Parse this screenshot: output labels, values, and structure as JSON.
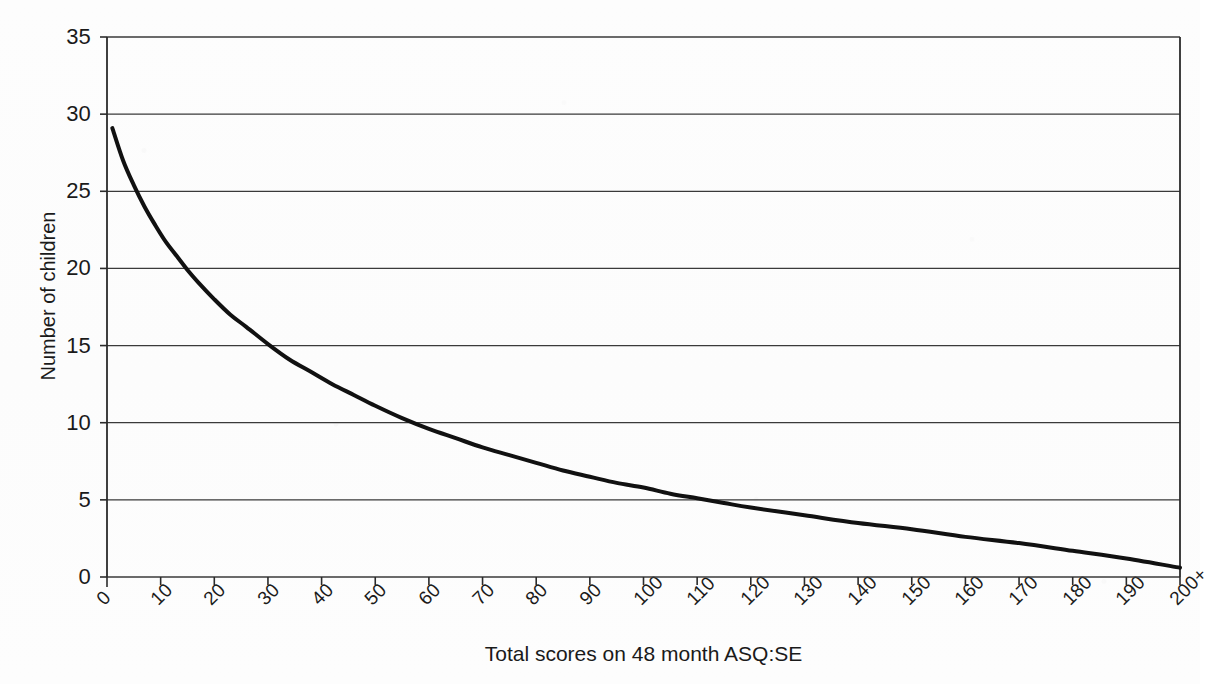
{
  "chart_data": {
    "type": "line",
    "title": "",
    "xlabel": "Total scores on 48 month ASQ:SE",
    "ylabel": "Number of children",
    "xlim": [
      0,
      200
    ],
    "ylim": [
      0,
      35
    ],
    "grid": true,
    "legend": "none",
    "y_ticks": [
      0,
      5,
      10,
      15,
      20,
      25,
      30,
      35
    ],
    "y_tick_labels": [
      "0",
      "5",
      "10",
      "15",
      "20",
      "25",
      "30",
      "35"
    ],
    "x_ticks": [
      0,
      10,
      20,
      30,
      40,
      50,
      60,
      70,
      80,
      90,
      100,
      110,
      120,
      130,
      140,
      150,
      160,
      170,
      180,
      190,
      200
    ],
    "x_tick_labels": [
      "0",
      "10",
      "20",
      "30",
      "40",
      "50",
      "60",
      "70",
      "80",
      "90",
      "100",
      "110",
      "120",
      "130",
      "140",
      "150",
      "160",
      "170",
      "180",
      "190",
      "200+"
    ],
    "series": [
      {
        "name": "Number of children",
        "color": "#111111",
        "line_width": 4,
        "x": [
          1,
          3,
          5,
          7,
          9,
          11,
          13,
          15,
          17,
          20,
          23,
          26,
          30,
          34,
          38,
          42,
          46,
          50,
          55,
          60,
          65,
          70,
          75,
          80,
          85,
          90,
          95,
          100,
          105,
          110,
          115,
          120,
          130,
          140,
          150,
          160,
          170,
          180,
          190,
          200
        ],
        "values": [
          29.1,
          27.0,
          25.4,
          24.0,
          22.8,
          21.7,
          20.8,
          19.9,
          19.1,
          18.0,
          17.0,
          16.2,
          15.1,
          14.1,
          13.3,
          12.5,
          11.8,
          11.1,
          10.3,
          9.6,
          9.0,
          8.4,
          7.9,
          7.4,
          6.9,
          6.5,
          6.1,
          5.8,
          5.4,
          5.1,
          4.8,
          4.5,
          4.0,
          3.5,
          3.1,
          2.6,
          2.2,
          1.7,
          1.2,
          0.6
        ]
      }
    ],
    "notes": [
      "Smooth monotonically decreasing curve (exponential-like decay).",
      "Crosses 25 near score 6, 20 near score 14, 15 near score 30, 10 near score 56, 5 near score 111.",
      "No legend, no data markers, horizontal gridlines only."
    ]
  },
  "axes": {
    "y_title": "Number of children",
    "x_title": "Total scores on 48 month ASQ:SE"
  },
  "style": {
    "plot_background": "#fdfdfd",
    "page_background": "#ffffff",
    "grid_color": "#3a3a3a",
    "axis_color": "#2b2b2b",
    "series_color": "#111111",
    "text_color": "#1a1a1a"
  }
}
